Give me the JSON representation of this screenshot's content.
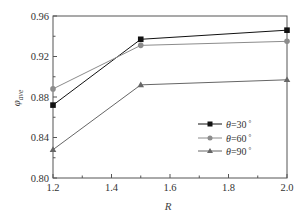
{
  "chart_data": {
    "type": "line",
    "title": "",
    "xlabel": "R",
    "ylabel": "φ_ave",
    "ylabel_main": "φ",
    "ylabel_sub": "ave",
    "x": [
      1.2,
      1.5,
      2.0
    ],
    "xlim": [
      1.2,
      2.0
    ],
    "ylim": [
      0.8,
      0.96
    ],
    "xticks": [
      "1.2",
      "1.4",
      "1.6",
      "1.8",
      "2.0"
    ],
    "yticks": [
      "0.80",
      "0.84",
      "0.88",
      "0.92",
      "0.96"
    ],
    "grid": false,
    "legend_position": "lower right (inside)",
    "series": [
      {
        "name": "θ=30°",
        "label_var": "θ",
        "label_val": "=30",
        "label_unit": "°",
        "marker": "square",
        "color": "#111111",
        "values": [
          0.872,
          0.937,
          0.946
        ]
      },
      {
        "name": "θ=60°",
        "label_var": "θ",
        "label_val": "=60",
        "label_unit": "°",
        "marker": "circle",
        "color": "#8c8c8c",
        "values": [
          0.888,
          0.931,
          0.935
        ]
      },
      {
        "name": "θ=90°",
        "label_var": "θ",
        "label_val": "=90",
        "label_unit": "°",
        "marker": "triangle",
        "color": "#666666",
        "values": [
          0.828,
          0.892,
          0.897
        ]
      }
    ]
  }
}
